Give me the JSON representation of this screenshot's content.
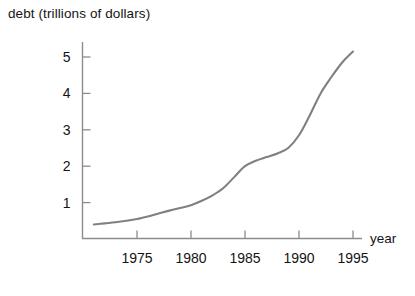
{
  "chart_data": {
    "type": "line",
    "title": "debt (trillions of dollars)",
    "xlabel": "year",
    "ylabel": "debt (trillions of dollars)",
    "xlim": [
      1971,
      1996.5
    ],
    "ylim": [
      0,
      5.6
    ],
    "xticks": [
      "1975",
      "1980",
      "1985",
      "1990",
      "1995"
    ],
    "xtick_values": [
      1975,
      1980,
      1985,
      1990,
      1995
    ],
    "yticks": [
      "1",
      "2",
      "3",
      "4",
      "5"
    ],
    "ytick_values": [
      1,
      2,
      3,
      4,
      5
    ],
    "grid": false,
    "legend": false,
    "line_color": "#808080",
    "axis_color": "#8c8c8c",
    "series": [
      {
        "name": "debt",
        "x": [
          1971,
          1972,
          1973,
          1974,
          1975,
          1976,
          1977,
          1978,
          1979,
          1980,
          1981,
          1982,
          1983,
          1984,
          1985,
          1986,
          1987,
          1988,
          1989,
          1990,
          1991,
          1992,
          1993,
          1994,
          1995
        ],
        "values": [
          0.4,
          0.43,
          0.46,
          0.5,
          0.55,
          0.62,
          0.7,
          0.78,
          0.85,
          0.93,
          1.05,
          1.2,
          1.4,
          1.7,
          2.0,
          2.15,
          2.25,
          2.35,
          2.5,
          2.85,
          3.4,
          4.0,
          4.45,
          4.85,
          5.15
        ]
      }
    ]
  },
  "axes": {
    "y_axis_name": "y-axis",
    "x_axis_name": "x-axis"
  }
}
